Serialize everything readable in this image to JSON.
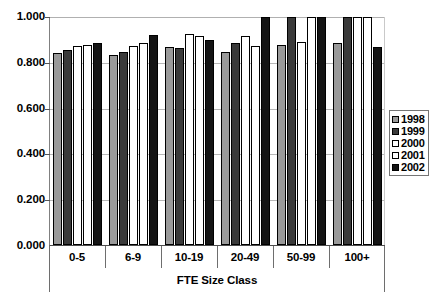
{
  "chart_data": {
    "type": "bar",
    "title": "",
    "subtitle": "",
    "xlabel": "FTE Size Class",
    "ylabel": "",
    "ylim": [
      0.0,
      1.0
    ],
    "ytick_step": 0.2,
    "ytick_labels": [
      "1.000",
      "0.800",
      "0.600",
      "0.400",
      "0.200",
      "0.000"
    ],
    "ytick_values": [
      1.0,
      0.8,
      0.6,
      0.4,
      0.2,
      0.0
    ],
    "grid": true,
    "legend_position": "right",
    "categories": [
      "0-5",
      "6-9",
      "10-19",
      "20-49",
      "50-99",
      "100+"
    ],
    "series": [
      {
        "name": "1998",
        "color": "#9a9a9a",
        "values": [
          0.84,
          0.835,
          0.87,
          0.845,
          0.877,
          0.885
        ]
      },
      {
        "name": "1999",
        "color": "#3a3a3a",
        "values": [
          0.855,
          0.845,
          0.865,
          0.885,
          1.0,
          1.0
        ]
      },
      {
        "name": "2000",
        "color": "#ffffff",
        "values": [
          0.875,
          0.875,
          0.925,
          0.915,
          0.89,
          1.0
        ]
      },
      {
        "name": "2001",
        "color": "#ffffff",
        "values": [
          0.877,
          0.885,
          0.915,
          0.875,
          1.0,
          1.0
        ]
      },
      {
        "name": "2002",
        "color": "#141414",
        "values": [
          0.885,
          0.92,
          0.9,
          1.0,
          1.0,
          0.87
        ]
      }
    ]
  },
  "legend": {
    "items": [
      {
        "label": "1998",
        "swatch": "s1998"
      },
      {
        "label": "1999",
        "swatch": "s1999"
      },
      {
        "label": "2000",
        "swatch": "s2000"
      },
      {
        "label": "2001",
        "swatch": "s2001"
      },
      {
        "label": "2002",
        "swatch": "s2002"
      }
    ]
  }
}
